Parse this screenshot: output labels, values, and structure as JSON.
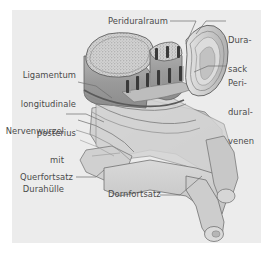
{
  "figure": {
    "kind": "anatomical-illustration",
    "language": "de",
    "panel_background": "#ececec",
    "page_background": "#ffffff",
    "label_color": "#4a4a4a",
    "leader_color": "#6d6d6d"
  },
  "labels": {
    "periduralraum": {
      "text": "Periduralraum",
      "align": "left",
      "x": 108,
      "y": 17
    },
    "durasack": {
      "line1": "Dura-",
      "line2": "sack",
      "align": "left",
      "x": 228,
      "y": 17
    },
    "ligamentum": {
      "line1": "Ligamentum",
      "line2": "longitudinale",
      "line3": "posterius",
      "align": "right",
      "x": 12,
      "y": 52
    },
    "periduralvenen": {
      "line1": "Peri-",
      "line2": "dural-",
      "line3": "venen",
      "align": "left",
      "x": 228,
      "y": 60
    },
    "nervenwurzel": {
      "line1": "Nervenwurzel",
      "line2": "mit",
      "line3": "Durahülle",
      "align": "right",
      "x": 12,
      "y": 108
    },
    "querfortsatz": {
      "text": "Querfortsatz",
      "align": "left",
      "x": 20,
      "y": 173
    },
    "dornfortsatz": {
      "text": "Dornfortsatz",
      "align": "left",
      "x": 108,
      "y": 190
    }
  },
  "anatomy": {
    "parts": [
      "Wirbelkörper (Schnittfläche, Spongiosa)",
      "Periduralraum",
      "Durasack",
      "Periduralvenen",
      "Ligamentum longitudinale posterius",
      "Nervenwurzel mit Durahülle",
      "Querfortsatz",
      "Dornfortsatz"
    ]
  }
}
